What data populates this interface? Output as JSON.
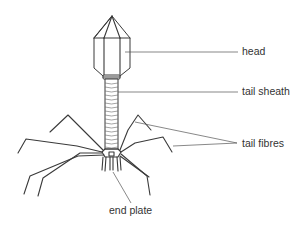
{
  "diagram": {
    "labels": {
      "head": "head",
      "tail_sheath": "tail sheath",
      "tail_fibres": "tail fibres",
      "end_plate": "end plate"
    },
    "colors": {
      "stroke": "#3a3a3a",
      "leader": "#555555",
      "text": "#333333",
      "background": "#ffffff"
    }
  }
}
